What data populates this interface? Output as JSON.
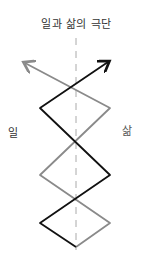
{
  "diagram": {
    "title": "일과 삶의 극단",
    "left_label": "일",
    "right_label": "삶",
    "colors": {
      "work_line": "#111111",
      "life_line": "#8a8a8a",
      "axis": "#aaaaaa"
    },
    "work_path": "M76,247 L40,223 L107,62",
    "life_path": "M76,247 L110,223 L25,65"
  }
}
